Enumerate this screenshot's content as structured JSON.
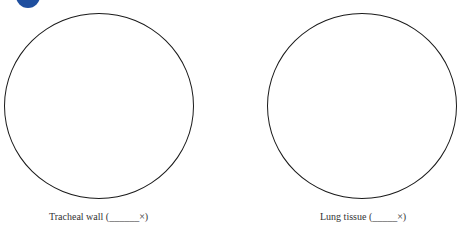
{
  "badge": {
    "color": "#1f4f9f"
  },
  "views": [
    {
      "label": "Tracheal wall (______×)"
    },
    {
      "label": "Lung tissue (_____×)"
    }
  ]
}
